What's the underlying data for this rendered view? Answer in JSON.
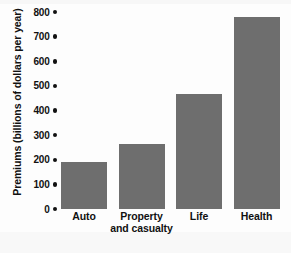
{
  "chart_data": {
    "type": "bar",
    "title": "",
    "xlabel": "",
    "ylabel": "Premiums (billions of dollars per year)",
    "categories": [
      "Auto",
      "Property and casualty",
      "Life",
      "Health"
    ],
    "category_lines": [
      [
        "Auto"
      ],
      [
        "Property",
        "and casualty"
      ],
      [
        "Life"
      ],
      [
        "Health"
      ]
    ],
    "values": [
      190,
      265,
      465,
      780
    ],
    "ylim": [
      0,
      800
    ],
    "ytick_values": [
      0,
      100,
      200,
      300,
      400,
      500,
      600,
      700,
      800
    ],
    "ytick_labels": [
      "0",
      "100",
      "200",
      "300",
      "400",
      "500",
      "600",
      "700",
      "800"
    ],
    "grid": false,
    "legend": null,
    "bar_color": "#6e6e6e",
    "text_color": "#111111",
    "background_color": "#fdfdfd",
    "tick_marker": "round-dot"
  }
}
